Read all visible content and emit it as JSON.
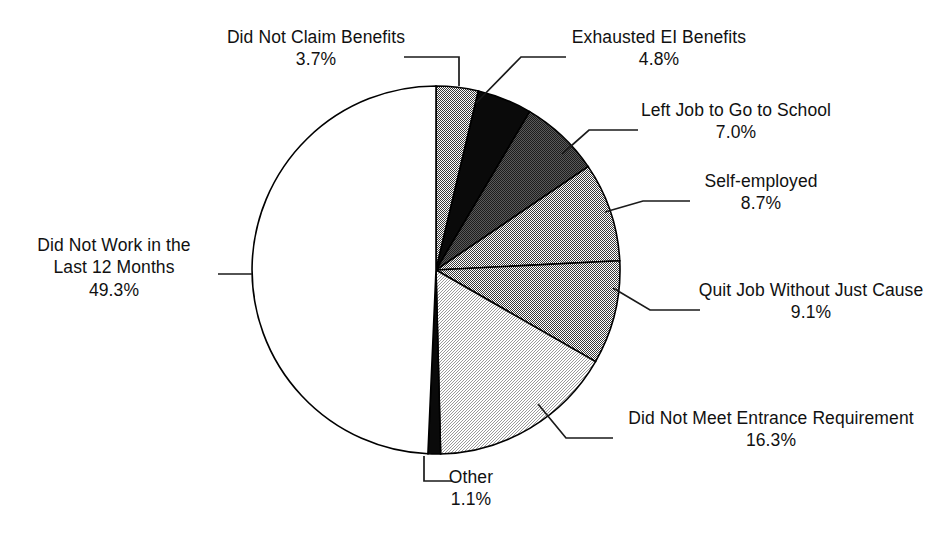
{
  "chart_data": {
    "type": "pie",
    "title": "",
    "subtitle": "",
    "xlabel": "",
    "ylabel": "",
    "legend_position": "none",
    "grid": false,
    "units": "percent",
    "total": 100.0,
    "start_angle_deg": 0,
    "direction": "clockwise",
    "categories": [
      "Did Not Claim Benefits",
      "Exhausted EI Benefits",
      "Left Job to Go to School",
      "Self-employed",
      "Quit Job Without Just Cause",
      "Did Not Meet Entrance Requirement",
      "Other",
      "Did Not Work in the Last 12 Months"
    ],
    "values": [
      3.7,
      4.8,
      7.0,
      8.7,
      9.1,
      16.3,
      1.1,
      49.3
    ],
    "value_labels": [
      "3.7%",
      "4.8%",
      "7.0%",
      "8.7%",
      "9.1%",
      "16.3%",
      "1.1%",
      "49.3%"
    ],
    "colors": [
      "#8a8a8a",
      "#0d0d0d",
      "#2b2b2b",
      "#434343",
      "#8d8d8d",
      "#d9d9d9",
      "#0a0a0a",
      "#ffffff"
    ],
    "slices": [
      {
        "name": "did-not-claim-benefits",
        "label": "Did Not Claim Benefits",
        "value": 3.7,
        "value_label": "3.7%",
        "color": "#8a8a8a",
        "start_deg": 0.0,
        "end_deg": 13.32
      },
      {
        "name": "exhausted-ei-benefits",
        "label": "Exhausted EI Benefits",
        "value": 4.8,
        "value_label": "4.8%",
        "color": "#0d0d0d",
        "start_deg": 13.32,
        "end_deg": 30.6
      },
      {
        "name": "left-job-to-go-to-school",
        "label": "Left Job to Go to School",
        "value": 7.0,
        "value_label": "7.0%",
        "color": "#2b2b2b",
        "start_deg": 30.6,
        "end_deg": 55.8
      },
      {
        "name": "self-employed",
        "label": "Self-employed",
        "value": 8.7,
        "value_label": "8.7%",
        "color": "#434343",
        "start_deg": 55.8,
        "end_deg": 87.12
      },
      {
        "name": "quit-job-without-just-cause",
        "label": "Quit Job Without Just Cause",
        "value": 9.1,
        "value_label": "9.1%",
        "color": "#8d8d8d",
        "start_deg": 87.12,
        "end_deg": 119.88
      },
      {
        "name": "did-not-meet-entrance-requirement",
        "label": "Did Not Meet Entrance Requirement",
        "value": 16.3,
        "value_label": "16.3%",
        "color": "#d9d9d9",
        "start_deg": 119.88,
        "end_deg": 178.56
      },
      {
        "name": "other",
        "label": "Other",
        "value": 1.1,
        "value_label": "1.1%",
        "color": "#0a0a0a",
        "start_deg": 178.56,
        "end_deg": 182.52
      },
      {
        "name": "did-not-work-in-the-last-12-months",
        "label": "Did Not Work in the Last 12 Months",
        "value": 49.3,
        "value_label": "49.3%",
        "color": "#ffffff",
        "start_deg": 182.52,
        "end_deg": 360.0
      }
    ]
  },
  "callouts": {
    "did_not_claim_benefits": {
      "line1": "Did Not Claim Benefits",
      "line2": "3.7%"
    },
    "exhausted_ei_benefits": {
      "line1": "Exhausted EI Benefits",
      "line2": "4.8%"
    },
    "left_job_to_go_to_school": {
      "line1": "Left Job to Go to School",
      "line2": "7.0%"
    },
    "self_employed": {
      "line1": "Self-employed",
      "line2": "8.7%"
    },
    "quit_job_without_just_cause": {
      "line1": "Quit Job Without Just Cause",
      "line2": "9.1%"
    },
    "did_not_meet_entrance_requirement": {
      "line1": "Did Not Meet Entrance Requirement",
      "line2": "16.3%"
    },
    "other": {
      "line1": "Other",
      "line2": "1.1%"
    },
    "did_not_work_last_12_months": {
      "line1": "Did Not Work in the",
      "line2": "Last 12 Months",
      "line3": "49.3%"
    }
  },
  "geometry": {
    "center_x": 436,
    "center_y": 270,
    "radius": 184
  }
}
